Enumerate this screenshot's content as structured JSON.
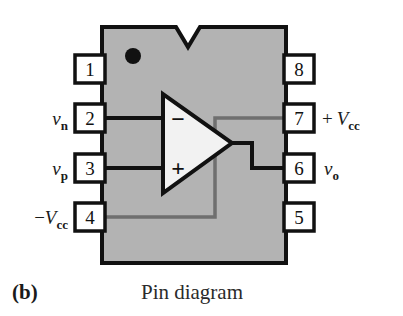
{
  "figure": {
    "caption_letter": "(b)",
    "caption_text": "Pin diagram",
    "kind": "dip8-opamp-pin-diagram"
  },
  "colors": {
    "background": "#ffffff",
    "chip_body": "#b3b3b3",
    "chip_outline": "#111111",
    "pin_box_fill": "#ffffff",
    "pin_box_outline": "#111111",
    "wire_black": "#111111",
    "wire_gray": "#6f6f6f",
    "triangle_fill": "#f2f2f2",
    "dot": "#111111",
    "text": "#1a1a1a"
  },
  "chip": {
    "notch_name": "top-notch",
    "orientation_dot_name": "pin1-orientation-dot"
  },
  "pins": {
    "left": [
      {
        "number": "1",
        "label_var": "",
        "label_sub": "",
        "label_prefix": "",
        "has_label": false
      },
      {
        "number": "2",
        "label_var": "v",
        "label_sub": "n",
        "label_prefix": "",
        "has_label": true
      },
      {
        "number": "3",
        "label_var": "v",
        "label_sub": "p",
        "label_prefix": "",
        "has_label": true
      },
      {
        "number": "4",
        "label_var": "V",
        "label_sub": "cc",
        "label_prefix": "−",
        "has_label": true
      }
    ],
    "right": [
      {
        "number": "8",
        "label_var": "",
        "label_sub": "",
        "label_prefix": "",
        "has_label": false
      },
      {
        "number": "7",
        "label_var": "V",
        "label_sub": "cc",
        "label_prefix": "+",
        "has_label": true
      },
      {
        "number": "6",
        "label_var": "v",
        "label_sub": "o",
        "label_prefix": "",
        "has_label": true
      },
      {
        "number": "5",
        "label_var": "",
        "label_sub": "",
        "label_prefix": "",
        "has_label": false
      }
    ]
  },
  "opamp": {
    "inverting_sign": "−",
    "noninverting_sign": "+",
    "inverting_pin": "2",
    "noninverting_pin": "3",
    "output_pin": "6",
    "vcc_plus_pin": "7",
    "vcc_minus_pin": "4"
  },
  "labels": {
    "pin2_full": "vₙ",
    "pin3_full": "vₚ",
    "pin4_full": "−Vᴄᴄ",
    "pin6_full": "vₒ",
    "pin7_full": "+Vᴄᴄ"
  }
}
